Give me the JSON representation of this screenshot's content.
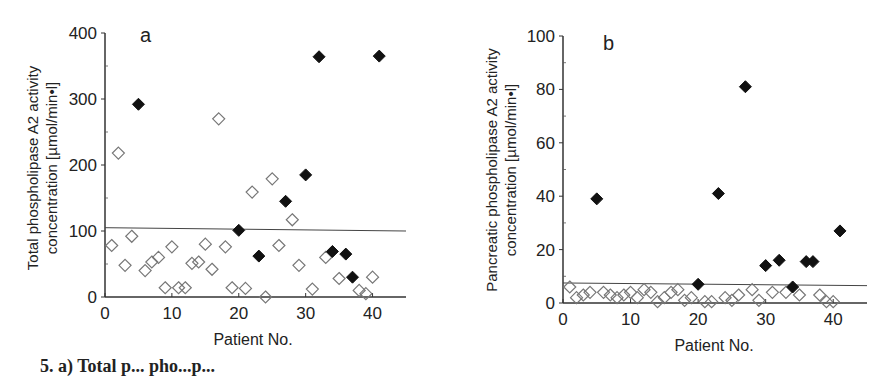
{
  "caption": "5. a) Total p... pho...p...",
  "chart_data": [
    {
      "id": "a",
      "type": "scatter",
      "panel_label": "a",
      "title": "",
      "xlabel": "Patient No.",
      "ylabel_line1": "Total phospholipase A2 activity",
      "ylabel_line2": "concentration   [µmol/min•l]",
      "xlim": [
        0,
        45
      ],
      "ylim": [
        0,
        400
      ],
      "xticks": [
        0,
        10,
        20,
        30,
        40
      ],
      "yticks": [
        0,
        100,
        200,
        300,
        400
      ],
      "grid": false,
      "threshold_line": {
        "y_start": 105,
        "y_end": 100
      },
      "series": [
        {
          "name": "open-diamonds",
          "marker": "open-diamond",
          "points": [
            [
              1,
              78
            ],
            [
              2,
              218
            ],
            [
              3,
              48
            ],
            [
              4,
              92
            ],
            [
              6,
              40
            ],
            [
              7,
              53
            ],
            [
              8,
              60
            ],
            [
              9,
              14
            ],
            [
              10,
              76
            ],
            [
              11,
              14
            ],
            [
              12,
              14
            ],
            [
              13,
              51
            ],
            [
              14,
              53
            ],
            [
              15,
              80
            ],
            [
              16,
              42
            ],
            [
              17,
              270
            ],
            [
              18,
              76
            ],
            [
              19,
              14
            ],
            [
              21,
              13
            ],
            [
              22,
              159
            ],
            [
              24,
              0
            ],
            [
              25,
              179
            ],
            [
              26,
              78
            ],
            [
              28,
              117
            ],
            [
              29,
              48
            ],
            [
              31,
              12
            ],
            [
              33,
              60
            ],
            [
              35,
              28
            ],
            [
              38,
              10
            ],
            [
              39,
              5
            ],
            [
              40,
              30
            ]
          ]
        },
        {
          "name": "filled-diamonds",
          "marker": "filled-diamond",
          "points": [
            [
              5,
              292
            ],
            [
              20,
              101
            ],
            [
              23,
              62
            ],
            [
              27,
              145
            ],
            [
              30,
              185
            ],
            [
              32,
              364
            ],
            [
              34,
              69
            ],
            [
              36,
              65
            ],
            [
              37,
              30
            ],
            [
              41,
              365
            ]
          ]
        }
      ]
    },
    {
      "id": "b",
      "type": "scatter",
      "panel_label": "b",
      "title": "",
      "xlabel": "Patient No.",
      "ylabel_line1": "Pancreatic phospholipase A2 activity",
      "ylabel_line2": "concentration   [µmol/min•l]",
      "xlim": [
        0,
        45
      ],
      "ylim": [
        0,
        100
      ],
      "xticks": [
        0,
        10,
        20,
        30,
        40
      ],
      "yticks": [
        0,
        20,
        40,
        60,
        80,
        100
      ],
      "grid": false,
      "threshold_line": {
        "y_start": 7.5,
        "y_end": 6.5
      },
      "series": [
        {
          "name": "open-diamonds",
          "marker": "open-diamond",
          "points": [
            [
              1,
              6
            ],
            [
              2,
              2
            ],
            [
              3,
              3
            ],
            [
              4,
              4
            ],
            [
              6,
              4
            ],
            [
              7,
              3
            ],
            [
              8,
              2
            ],
            [
              9,
              3
            ],
            [
              10,
              4
            ],
            [
              11,
              2
            ],
            [
              12,
              5
            ],
            [
              13,
              4
            ],
            [
              14,
              0.5
            ],
            [
              15,
              2
            ],
            [
              16,
              4
            ],
            [
              17,
              5
            ],
            [
              18,
              1
            ],
            [
              19,
              2
            ],
            [
              21,
              0.5
            ],
            [
              22,
              0.5
            ],
            [
              24,
              2
            ],
            [
              25,
              1
            ],
            [
              26,
              3
            ],
            [
              28,
              5
            ],
            [
              29,
              1
            ],
            [
              31,
              4
            ],
            [
              33,
              4
            ],
            [
              35,
              3
            ],
            [
              38,
              3
            ],
            [
              39,
              0.5
            ],
            [
              40,
              0.5
            ]
          ]
        },
        {
          "name": "filled-diamonds",
          "marker": "filled-diamond",
          "points": [
            [
              5,
              39
            ],
            [
              20,
              7
            ],
            [
              23,
              41
            ],
            [
              27,
              81
            ],
            [
              30,
              14
            ],
            [
              32,
              16
            ],
            [
              34,
              6
            ],
            [
              36,
              15.5
            ],
            [
              37,
              15.5
            ],
            [
              41,
              27
            ]
          ]
        }
      ]
    }
  ]
}
